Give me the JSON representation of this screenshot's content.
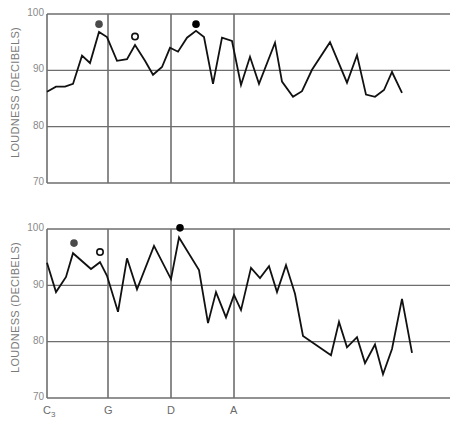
{
  "chart_data": [
    {
      "type": "line",
      "title": "",
      "xlabel": "",
      "ylabel": "LOUDNESS (DECIBELS)",
      "ylim": [
        70,
        100
      ],
      "yticks": [
        70,
        80,
        90,
        100
      ],
      "grid": true,
      "x_markers": [
        "G",
        "D",
        "A"
      ],
      "series": [
        {
          "name": "upper trace",
          "values": [
            86.2,
            87.1,
            87.1,
            87.6,
            92.6,
            91.3,
            96.8,
            95.9,
            91.7,
            92.0,
            94.5,
            91.7,
            89.2,
            90.6,
            94.0,
            93.3,
            95.8,
            97.0,
            95.9,
            87.6,
            95.8,
            95.2,
            87.4,
            92.4,
            87.6,
            94.9,
            88.0,
            85.3,
            86.3,
            90.1,
            95.0,
            87.8,
            92.7,
            85.7,
            85.3,
            86.5,
            89.7,
            86.0
          ]
        }
      ],
      "markers": [
        {
          "type": "filled-gray",
          "x_px": 99,
          "value": 98.2
        },
        {
          "type": "open",
          "x_px": 135,
          "value": 96.0
        },
        {
          "type": "filled-black",
          "x_px": 196,
          "value": 98.2
        }
      ]
    },
    {
      "type": "line",
      "title": "",
      "xlabel": "",
      "ylabel": "LOUDNESS (DECIBELS)",
      "ylim": [
        70,
        100
      ],
      "yticks": [
        70,
        80,
        90,
        100
      ],
      "grid": true,
      "xtick_labels": [
        "C3",
        "G",
        "D",
        "A"
      ],
      "series": [
        {
          "name": "lower trace",
          "values": [
            94.0,
            88.8,
            91.5,
            95.7,
            92.9,
            94.1,
            91.7,
            85.3,
            94.8,
            89.3,
            97.0,
            91.1,
            98.5,
            92.7,
            83.3,
            88.8,
            84.3,
            88.3,
            85.6,
            93.1,
            91.3,
            93.4,
            88.8,
            93.6,
            88.5,
            81.0,
            77.6,
            83.5,
            79.0,
            80.8,
            76.2,
            79.5,
            74.2,
            78.7,
            87.6,
            78.0
          ]
        }
      ],
      "markers": [
        {
          "type": "filled-gray",
          "x_px": 74,
          "value": 97.5
        },
        {
          "type": "open",
          "x_px": 100,
          "value": 95.9
        },
        {
          "type": "filled-black",
          "x_px": 180,
          "value": 100.2
        }
      ]
    }
  ],
  "top": {
    "ylabel": "LOUDNESS (DECIBELS)",
    "ticks": {
      "t100": "100",
      "t90": "90",
      "t80": "80",
      "t70": "70"
    }
  },
  "bottom": {
    "ylabel": "LOUDNESS (DECIBELS)",
    "ticks": {
      "t100": "100",
      "t90": "90",
      "t80": "80",
      "t70": "70"
    },
    "xticks": {
      "c3": "C",
      "c3_sub": "3",
      "g": "G",
      "d": "D",
      "a": "A"
    }
  },
  "colors": {
    "line": "#111111",
    "grid": "#6e6e6e",
    "axis_text": "#8a8a8a",
    "marker_gray": "#4a4a4a",
    "marker_black": "#000000"
  }
}
